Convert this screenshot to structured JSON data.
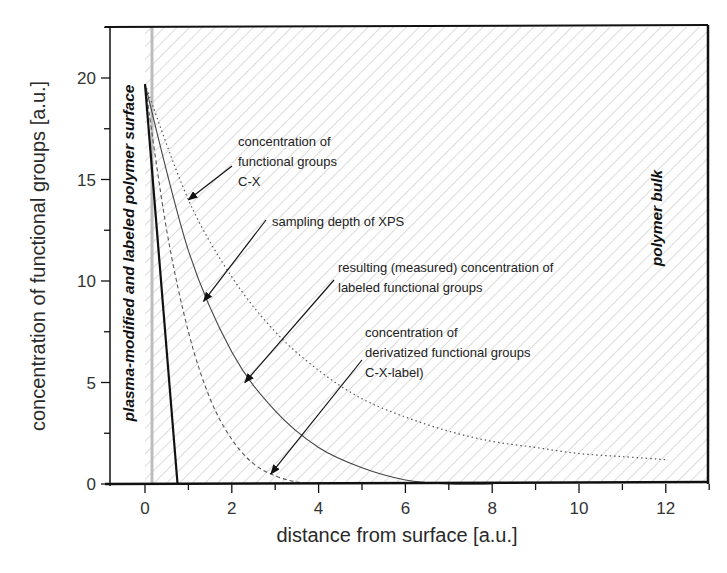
{
  "chart_data": {
    "type": "line",
    "title": "",
    "xlabel": "distance from surface [a.u.]",
    "ylabel": "concentration of functional groups [a.u.]",
    "xlim": [
      -0.8,
      13
    ],
    "ylim": [
      0,
      22.5
    ],
    "x_ticks": [
      0,
      2,
      4,
      6,
      8,
      10,
      12
    ],
    "y_ticks": [
      0,
      5,
      10,
      15,
      20
    ],
    "grid": false,
    "legend": null,
    "regions": [
      {
        "name": "plasma-modified and labeled polymer surface",
        "x_range": [
          -0.8,
          0
        ],
        "fill": "white"
      },
      {
        "name": "polymer bulk",
        "x_range": [
          0,
          13
        ],
        "fill": "diagonal hatching"
      }
    ],
    "series": [
      {
        "name": "concentration of functional groups C-X",
        "style": "dotted",
        "x": [
          0,
          1,
          2,
          3,
          4,
          5,
          6,
          7,
          8,
          9,
          10,
          11,
          12
        ],
        "y": [
          19.7,
          14.0,
          10.2,
          7.5,
          5.6,
          4.2,
          3.3,
          2.6,
          2.1,
          1.8,
          1.5,
          1.35,
          1.2
        ]
      },
      {
        "name": "resulting (measured) concentration of labeled functional groups",
        "style": "solid-thin",
        "x": [
          0,
          1,
          2,
          3,
          4,
          5,
          6,
          7,
          8
        ],
        "y": [
          19.7,
          11.5,
          6.5,
          3.6,
          1.8,
          0.8,
          0.2,
          0.0,
          0.0
        ]
      },
      {
        "name": "concentration of derivatized functional groups C-X-label)",
        "style": "dashed",
        "x": [
          0,
          0.5,
          1,
          1.5,
          2,
          2.5,
          3,
          3.5,
          4
        ],
        "y": [
          19.7,
          12.5,
          7.5,
          4.2,
          2.2,
          1.0,
          0.4,
          0.1,
          0.0
        ]
      },
      {
        "name": "sampling depth of XPS",
        "style": "solid-thick",
        "x": [
          0,
          0.75
        ],
        "y": [
          19.7,
          0
        ]
      }
    ],
    "annotations": [
      {
        "text": [
          "concentration of",
          "functional groups",
          "C-X"
        ],
        "arrow_to": [
          1.0,
          14.0
        ]
      },
      {
        "text": [
          "sampling depth of XPS"
        ],
        "arrow_to": [
          1.35,
          9.0
        ]
      },
      {
        "text": [
          "resulting (measured) concentration of",
          "labeled functional groups"
        ],
        "arrow_to": [
          2.3,
          5.0
        ]
      },
      {
        "text": [
          "concentration of",
          "derivatized functional groups",
          "C-X-label)"
        ],
        "arrow_to": [
          2.9,
          0.5
        ]
      }
    ]
  },
  "labels": {
    "xlabel": "distance from surface [a.u.]",
    "ylabel": "concentration of functional groups [a.u.]",
    "surface_region": "plasma-modified and labeled polymer surface",
    "bulk_region": "polymer bulk",
    "x_ticks": [
      "0",
      "2",
      "4",
      "6",
      "8",
      "10",
      "12"
    ],
    "y_ticks": [
      "0",
      "5",
      "10",
      "15",
      "20"
    ],
    "annot_cx": [
      "concentration of",
      "functional groups",
      "C-X"
    ],
    "annot_xps": "sampling depth of XPS",
    "annot_measured": [
      "resulting (measured) concentration of",
      "labeled functional groups"
    ],
    "annot_derivatized": [
      "concentration of",
      "derivatized functional groups",
      "C-X-label)"
    ]
  }
}
